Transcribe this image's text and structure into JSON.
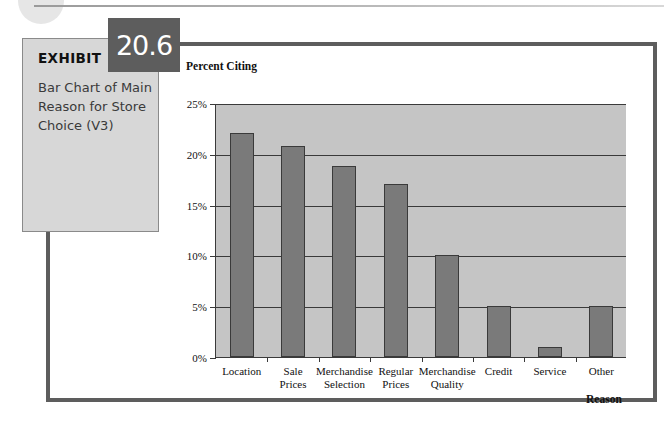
{
  "page": {
    "decorations": {
      "corner_circle": "decorative-circle",
      "top_rule": "decorative-rule"
    },
    "frame_color": "#5d5d5d"
  },
  "exhibit": {
    "label": "EXHIBIT",
    "number": "20.6",
    "caption": "Bar Chart of Main Reason for Store Choice (V3)",
    "box_color": "#d7d7d7",
    "badge_color": "#5d5d5d"
  },
  "chart_data": {
    "type": "bar",
    "title": "",
    "ylabel": "Percent Citing",
    "xlabel": "Reason",
    "categories": [
      "Location",
      "Sale\nPrices",
      "Merchandise\nSelection",
      "Regular\nPrices",
      "Merchandise\nQuality",
      "Credit",
      "Service",
      "Other"
    ],
    "values": [
      22,
      20.8,
      18.8,
      17,
      10,
      5,
      1,
      5
    ],
    "ylim": [
      0,
      25
    ],
    "ytick_values": [
      0,
      5,
      10,
      15,
      20,
      25
    ],
    "ytick_labels": [
      "0%",
      "5%",
      "10%",
      "15%",
      "20%",
      "25%"
    ],
    "grid": true,
    "legend": false,
    "bar_color": "#7a7a7a",
    "plot_background": "#c5c5c5",
    "axis_color": "#3a3a3a"
  }
}
